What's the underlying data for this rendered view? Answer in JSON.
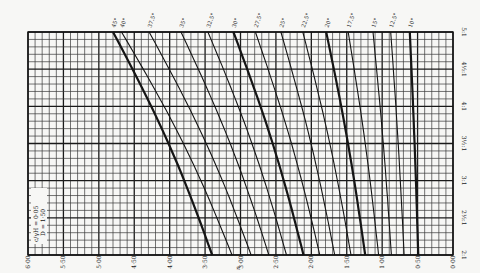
{
  "chart_data": {
    "type": "line",
    "title": "",
    "orientation_note": "figure printed rotated 90 degrees",
    "xlabel": "n",
    "ylabel": "ratio",
    "x_axis": {
      "ticks": [
        "6·00",
        "5·50",
        "5·00",
        "4·50",
        "4·00",
        "3·50",
        "3·00",
        "2·50",
        "2·00",
        "1·50",
        "1·00",
        "0·50",
        "0·00"
      ],
      "range": [
        6.0,
        0.0
      ]
    },
    "y_axis": {
      "ticks": [
        "2:1",
        "2½:1",
        "3:1",
        "3½:1",
        "4:1",
        "4½:1",
        "5:1"
      ],
      "range": [
        2.0,
        5.0
      ]
    },
    "legend_box": {
      "line1": "c/γH = 0·05",
      "line2": "D = 1·50"
    },
    "grid": true,
    "series": [
      {
        "name": "45°",
        "bold": true,
        "n_at_5to1": 4.8,
        "n_at_2to1": 3.4
      },
      {
        "name": "40°",
        "bold": false,
        "n_at_5to1": 4.68,
        "n_at_2to1": 3.12
      },
      {
        "name": "37.5°",
        "bold": false,
        "n_at_5to1": 4.29,
        "n_at_2to1": 2.85
      },
      {
        "name": "35°",
        "bold": false,
        "n_at_5to1": 3.84,
        "n_at_2to1": 2.6
      },
      {
        "name": "32.5°",
        "bold": false,
        "n_at_5to1": 3.46,
        "n_at_2to1": 2.35
      },
      {
        "name": "30°",
        "bold": true,
        "n_at_5to1": 3.1,
        "n_at_2to1": 2.11
      },
      {
        "name": "27.5°",
        "bold": false,
        "n_at_5to1": 2.79,
        "n_at_2to1": 1.88
      },
      {
        "name": "25°",
        "bold": false,
        "n_at_5to1": 2.43,
        "n_at_2to1": 1.67
      },
      {
        "name": "22.5°",
        "bold": false,
        "n_at_5to1": 2.12,
        "n_at_2to1": 1.44
      },
      {
        "name": "20°",
        "bold": true,
        "n_at_5to1": 1.79,
        "n_at_2to1": 1.24
      },
      {
        "name": "17.5°",
        "bold": false,
        "n_at_5to1": 1.48,
        "n_at_2to1": 1.05
      },
      {
        "name": "15°",
        "bold": false,
        "n_at_5to1": 1.13,
        "n_at_2to1": 0.87
      },
      {
        "name": "12.5°",
        "bold": false,
        "n_at_5to1": 0.88,
        "n_at_2to1": 0.69
      },
      {
        "name": "10°",
        "bold": true,
        "n_at_5to1": 0.61,
        "n_at_2to1": 0.49
      }
    ]
  },
  "labels": {
    "x_title": "n",
    "legend_line1": "c/γH = 0·05",
    "legend_line2": "D = 1·50"
  }
}
